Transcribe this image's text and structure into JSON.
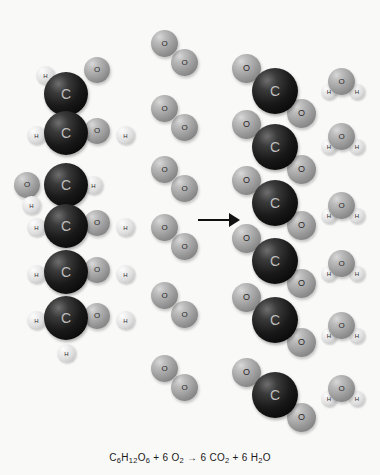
{
  "figure": {
    "background_color": "#f9f9f8",
    "arrow": {
      "name": "reaction-arrow",
      "direction": "right",
      "color": "#111111"
    },
    "equation": {
      "text": "C6H12O6 + 6 O2 → 6 CO2 + 6 H2O",
      "parts": [
        {
          "t": "C"
        },
        {
          "t": "6",
          "sub": true
        },
        {
          "t": "H"
        },
        {
          "t": "12",
          "sub": true
        },
        {
          "t": "O"
        },
        {
          "t": "6",
          "sub": true
        },
        {
          "t": " + 6 O"
        },
        {
          "t": "2",
          "sub": true
        },
        {
          "t": " → 6 CO"
        },
        {
          "t": "2",
          "sub": true
        },
        {
          "t": " + 6 H"
        },
        {
          "t": "2",
          "sub": true
        },
        {
          "t": "O"
        }
      ]
    }
  },
  "atom_colors": {
    "carbon": "#141414",
    "oxygen": "#a2a2a2",
    "hydrogen": "#ededed"
  },
  "atom_labels": {
    "carbon": "C",
    "oxygen": "O",
    "hydrogen": "H"
  },
  "reactants": {
    "glucose": {
      "name": "glucose",
      "formula": "C6H12O6",
      "carbon_count": 6,
      "atoms": [
        {
          "el": "h",
          "label": "H",
          "x": 36,
          "y": 66,
          "d": 19
        },
        {
          "el": "o",
          "label": "O",
          "x": 84,
          "y": 57,
          "d": 26
        },
        {
          "el": "c",
          "label": "C",
          "x": 44,
          "y": 72,
          "d": 44
        },
        {
          "el": "h",
          "label": "H",
          "x": 27,
          "y": 126,
          "d": 19
        },
        {
          "el": "h",
          "label": "H",
          "x": 116,
          "y": 126,
          "d": 19
        },
        {
          "el": "o",
          "label": "O",
          "x": 84,
          "y": 118,
          "d": 26
        },
        {
          "el": "c",
          "label": "C",
          "x": 44,
          "y": 111,
          "d": 44
        },
        {
          "el": "o",
          "label": "O",
          "x": 14,
          "y": 172,
          "d": 26
        },
        {
          "el": "h",
          "label": "H",
          "x": 22,
          "y": 196,
          "d": 19
        },
        {
          "el": "h",
          "label": "H",
          "x": 84,
          "y": 176,
          "d": 19
        },
        {
          "el": "c",
          "label": "C",
          "x": 44,
          "y": 163,
          "d": 44
        },
        {
          "el": "h",
          "label": "H",
          "x": 27,
          "y": 218,
          "d": 19
        },
        {
          "el": "h",
          "label": "H",
          "x": 116,
          "y": 218,
          "d": 19
        },
        {
          "el": "o",
          "label": "O",
          "x": 84,
          "y": 210,
          "d": 26
        },
        {
          "el": "c",
          "label": "C",
          "x": 44,
          "y": 204,
          "d": 44
        },
        {
          "el": "h",
          "label": "H",
          "x": 27,
          "y": 265,
          "d": 19
        },
        {
          "el": "h",
          "label": "H",
          "x": 116,
          "y": 265,
          "d": 19
        },
        {
          "el": "o",
          "label": "O",
          "x": 84,
          "y": 257,
          "d": 26
        },
        {
          "el": "c",
          "label": "C",
          "x": 44,
          "y": 250,
          "d": 44
        },
        {
          "el": "h",
          "label": "H",
          "x": 27,
          "y": 311,
          "d": 19
        },
        {
          "el": "h",
          "label": "H",
          "x": 116,
          "y": 311,
          "d": 19
        },
        {
          "el": "o",
          "label": "O",
          "x": 84,
          "y": 303,
          "d": 26
        },
        {
          "el": "c",
          "label": "C",
          "x": 44,
          "y": 296,
          "d": 44
        },
        {
          "el": "h",
          "label": "H",
          "x": 57,
          "y": 344,
          "d": 19
        }
      ]
    },
    "oxygen_molecules": {
      "name": "oxygen",
      "formula": "O2",
      "count": 6,
      "molecules": [
        {
          "o1x": 151,
          "o1y": 30,
          "o2x": 171,
          "o2y": 49
        },
        {
          "o1x": 151,
          "o1y": 95,
          "o2x": 171,
          "o2y": 114
        },
        {
          "o1x": 151,
          "o1y": 156,
          "o2x": 171,
          "o2y": 175
        },
        {
          "o1x": 151,
          "o1y": 214,
          "o2x": 171,
          "o2y": 233
        },
        {
          "o1x": 151,
          "o1y": 282,
          "o2x": 171,
          "o2y": 301
        },
        {
          "o1x": 151,
          "o1y": 355,
          "o2x": 171,
          "o2y": 374
        }
      ],
      "atom_diameter": 27
    }
  },
  "products": {
    "carbon_dioxide": {
      "name": "carbon dioxide",
      "formula": "CO2",
      "count": 6,
      "molecules": [
        {
          "cx": 252,
          "cy": 68,
          "o1x": 232,
          "o1y": 54,
          "o2x": 287,
          "o2y": 99
        },
        {
          "cx": 252,
          "cy": 124,
          "o1x": 232,
          "o1y": 110,
          "o2x": 287,
          "o2y": 155
        },
        {
          "cx": 252,
          "cy": 180,
          "o1x": 232,
          "o1y": 166,
          "o2x": 287,
          "o2y": 211
        },
        {
          "cx": 252,
          "cy": 238,
          "o1x": 232,
          "o1y": 224,
          "o2x": 287,
          "o2y": 269
        },
        {
          "cx": 252,
          "cy": 297,
          "o1x": 232,
          "o1y": 283,
          "o2x": 287,
          "o2y": 328
        },
        {
          "cx": 252,
          "cy": 372,
          "o1x": 232,
          "o1y": 358,
          "o2x": 287,
          "o2y": 403
        }
      ],
      "carbon_diameter": 46,
      "oxygen_diameter": 29
    },
    "water_molecules": {
      "name": "water",
      "formula": "H2O",
      "count": 6,
      "molecules": [
        {
          "ox": 328,
          "oy": 68,
          "h1x": 321,
          "h1y": 84,
          "h2x": 349,
          "h2y": 84
        },
        {
          "ox": 328,
          "oy": 123,
          "h1x": 321,
          "h1y": 139,
          "h2x": 349,
          "h2y": 139
        },
        {
          "ox": 328,
          "oy": 192,
          "h1x": 321,
          "h1y": 208,
          "h2x": 349,
          "h2y": 208
        },
        {
          "ox": 328,
          "oy": 250,
          "h1x": 321,
          "h1y": 266,
          "h2x": 349,
          "h2y": 266
        },
        {
          "ox": 328,
          "oy": 312,
          "h1x": 321,
          "h1y": 328,
          "h2x": 349,
          "h2y": 328
        },
        {
          "ox": 328,
          "oy": 375,
          "h1x": 321,
          "h1y": 391,
          "h2x": 349,
          "h2y": 391
        }
      ],
      "oxygen_diameter": 27,
      "hydrogen_diameter": 16
    }
  },
  "arrow_geometry": {
    "x": 198,
    "y": 213,
    "width": 42,
    "height": 14
  }
}
